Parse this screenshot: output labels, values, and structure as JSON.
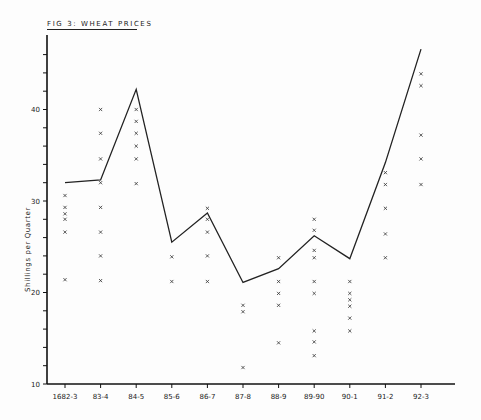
{
  "figure": {
    "title": "FIG 3: WHEAT PRICES"
  },
  "chart_data": {
    "type": "line",
    "title": "FIG 3: WHEAT PRICES",
    "xlabel": "",
    "ylabel": "Shillings per Quarter",
    "ylim": [
      10,
      47
    ],
    "yticks_labeled": [
      10,
      20,
      30,
      40
    ],
    "ytick_minor_step": 2,
    "grid": false,
    "legend": null,
    "categories": [
      "1682-3",
      "83-4",
      "84-5",
      "85-6",
      "86-7",
      "87-8",
      "88-9",
      "89-90",
      "90-1",
      "91-2",
      "92-3"
    ],
    "series": [
      {
        "name": "Average price (line)",
        "type": "line",
        "values": [
          32.0,
          32.3,
          42.2,
          25.5,
          28.7,
          21.1,
          22.6,
          26.2,
          23.7,
          34.2,
          46.6
        ]
      },
      {
        "name": "Individual market prices (x markers)",
        "type": "scatter",
        "values": [
          [
            30.6,
            29.3,
            28.6,
            28.0,
            26.6,
            21.4
          ],
          [
            40.0,
            37.4,
            34.6,
            32.0,
            29.3,
            26.6,
            24.0,
            21.3
          ],
          [
            40.0,
            38.7,
            37.4,
            36.0,
            34.6,
            31.9
          ],
          [
            23.9,
            21.2
          ],
          [
            29.2,
            28.0,
            26.6,
            24.0,
            21.2
          ],
          [
            18.6,
            17.9,
            11.8
          ],
          [
            23.8,
            21.2,
            19.9,
            18.6,
            14.5
          ],
          [
            28.0,
            26.8,
            24.6,
            23.8,
            21.2,
            19.9,
            15.8,
            14.6,
            13.1
          ],
          [
            21.2,
            19.9,
            19.2,
            18.5,
            17.2,
            15.8
          ],
          [
            33.1,
            31.8,
            29.2,
            26.4,
            23.8
          ],
          [
            43.9,
            42.6,
            37.2,
            34.6,
            31.8
          ]
        ]
      }
    ]
  },
  "colors": {
    "ink": "#222222",
    "background": "#fdfdfd"
  }
}
